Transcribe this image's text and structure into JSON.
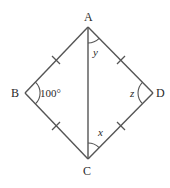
{
  "diagram": {
    "type": "kite",
    "stroke_color": "#555555",
    "vertices": [
      {
        "id": "A",
        "label": "A",
        "x": 88,
        "y": 27
      },
      {
        "id": "B",
        "label": "B",
        "x": 25,
        "y": 93
      },
      {
        "id": "C",
        "label": "C",
        "x": 88,
        "y": 159
      },
      {
        "id": "D",
        "label": "D",
        "x": 153,
        "y": 93
      }
    ],
    "sides": [
      "AB",
      "BC",
      "CD",
      "DA",
      "AC"
    ],
    "equal_side_marks": [
      "AB",
      "BC",
      "CD",
      "DA"
    ],
    "angles": [
      {
        "vertex": "B",
        "label": "100°"
      },
      {
        "vertex": "A",
        "label": "y"
      },
      {
        "vertex": "C",
        "label": "x"
      },
      {
        "vertex": "D",
        "label": "z"
      }
    ]
  }
}
